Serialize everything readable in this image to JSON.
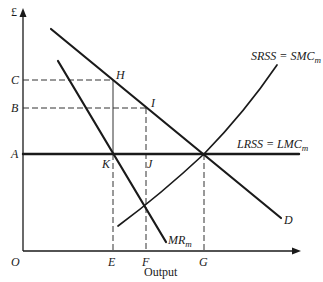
{
  "figure": {
    "y_axis_label": "£",
    "x_axis_label": "Output",
    "origin_label": "O",
    "price_levels": [
      {
        "label": "C",
        "y": 80
      },
      {
        "label": "B",
        "y": 108
      },
      {
        "label": "A",
        "y": 154
      }
    ],
    "quantity_levels": [
      {
        "label": "E",
        "x": 113
      },
      {
        "label": "F",
        "x": 146
      },
      {
        "label": "G",
        "x": 204
      }
    ],
    "points": [
      {
        "label": "H",
        "x": 113,
        "y": 80
      },
      {
        "label": "I",
        "x": 146,
        "y": 108
      },
      {
        "label": "K",
        "x": 113,
        "y": 154
      },
      {
        "label": "J",
        "x": 146,
        "y": 154
      }
    ],
    "curves": {
      "demand": {
        "label": "D"
      },
      "marginal_revenue": {
        "label": "MR",
        "subscript": "m"
      },
      "short_run_supply": {
        "label": "SRSS = SMC",
        "subscript": "m"
      },
      "long_run_supply": {
        "label": "LRSS = LMC",
        "subscript": "m"
      }
    },
    "colors": {
      "line": "#1a1a1a",
      "dashed": "#333333",
      "background": "#ffffff"
    }
  }
}
